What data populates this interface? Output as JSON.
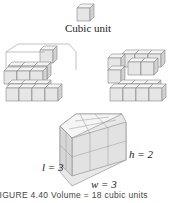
{
  "labels": {
    "cubic_unit": "Cubic unit",
    "length": "l = 3",
    "height": "h = 2",
    "width": "w = 3"
  },
  "caption": "FIGURE 4.40 Volume = 18 cubic units",
  "colors": {
    "cube_top": "#f4f4f4",
    "cube_front": "#e4e4e4",
    "cube_side": "#d4d4d4",
    "edge": "#888888"
  }
}
